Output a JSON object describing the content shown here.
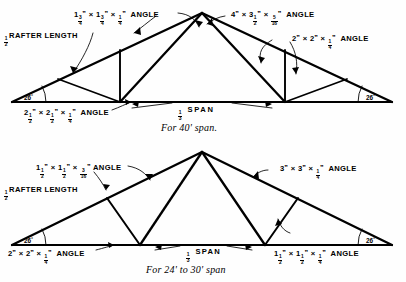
{
  "figure": {
    "line_color": "#000000",
    "background": "#fefefe"
  },
  "trusses": [
    {
      "id": "upper-truss",
      "caption": "For 40' span.",
      "span_label_whole": "",
      "span_label_num": "1",
      "span_label_den": "3",
      "span_label_text": "SPAN",
      "rafter_label_num": "1",
      "rafter_label_den": "2",
      "rafter_label_text": "RAFTER LENGTH",
      "pitch_angle_left": "26",
      "pitch_angle_right": "26",
      "degree_symbol": "°",
      "members": [
        {
          "name": "top-chord-left",
          "text_parts": [
            "1",
            "3",
            "4",
            "×",
            "1",
            "3",
            "4",
            "×",
            "1",
            "4",
            "ANGLE"
          ],
          "plain": "1 3/4\" x 1 3/4\" x 1/4\" ANGLE"
        },
        {
          "name": "top-chord-right",
          "plain": "4\" x 3 1/2\" x 5/16\" ANGLE"
        },
        {
          "name": "web-member",
          "plain": "2\" x 2\" x 1/4\" ANGLE"
        },
        {
          "name": "bottom-chord",
          "plain": "2 1/2\" x 2 1/2\" x 1/4\" ANGLE"
        }
      ]
    },
    {
      "id": "lower-truss",
      "caption": "For 24' to 30' span",
      "span_label_num": "1",
      "span_label_den": "3",
      "span_label_text": "SPAN",
      "rafter_label_num": "1",
      "rafter_label_den": "2",
      "rafter_label_text": "RAFTER LENGTH",
      "pitch_angle_left": "26",
      "pitch_angle_right": "26",
      "degree_symbol": "°",
      "members": [
        {
          "name": "top-chord-left",
          "plain": "1 1/2\" x 1 1/2\" x 3/16\" ANGLE"
        },
        {
          "name": "top-chord-right",
          "plain": "3\" x 3\" x 1/4\" ANGLE"
        },
        {
          "name": "bottom-chord",
          "plain": "2\" x 2\" x 1/4\" ANGLE"
        },
        {
          "name": "web-member",
          "plain": "1 1/2\" x 1 1/2\" x 1/4\" ANGLE"
        }
      ]
    }
  ],
  "labels": {
    "inch": "\"",
    "times": "×",
    "angle_word": "ANGLE"
  }
}
